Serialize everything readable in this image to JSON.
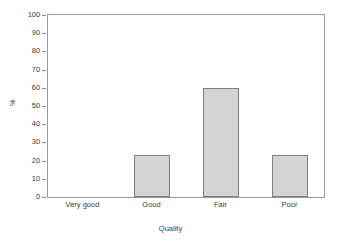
{
  "chart_data": {
    "type": "bar",
    "title": "",
    "subtitle": "",
    "categories": [
      "Very good",
      "Good",
      "Fair",
      "Poor"
    ],
    "values": [
      0,
      23,
      60,
      23
    ],
    "series": [
      {
        "name": "%",
        "values": [
          0,
          23,
          60,
          23
        ]
      }
    ],
    "xlabel": "Quality",
    "ylabel": "%",
    "ylim": [
      0,
      100
    ],
    "ytick_labels": [
      "0",
      "10",
      "20",
      "30",
      "40",
      "50",
      "60",
      "70",
      "80",
      "90",
      "100"
    ],
    "ytick_values": [
      0,
      10,
      20,
      30,
      40,
      50,
      60,
      70,
      80,
      90,
      100
    ],
    "grid": false,
    "legend": false,
    "legend_position": "none",
    "annotations": [],
    "colors": {
      "bar_fill": "#d4d4d4",
      "bar_border": "#7e7e7e",
      "axis_line": "#9a9a9a",
      "text": "#3a3a3a",
      "background": "#ffffff"
    }
  }
}
